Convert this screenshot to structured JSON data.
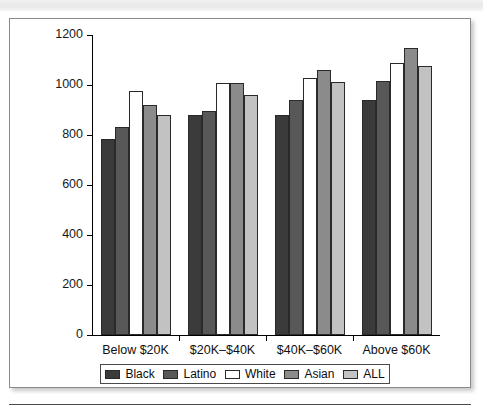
{
  "page": {
    "top_strip_text": "",
    "background_color": "#ffffff",
    "figure_border_color": "#8a8a8a"
  },
  "chart_data": {
    "type": "bar",
    "title": "",
    "subtitle": "",
    "xlabel": "",
    "ylabel": "",
    "ylim": [
      0,
      1200
    ],
    "ytick_values": [
      0,
      200,
      400,
      600,
      800,
      1000,
      1200
    ],
    "ytick_labels": [
      "0",
      "200",
      "400",
      "600",
      "800",
      "1000",
      "1200"
    ],
    "grid": false,
    "legend_position": "bottom",
    "categories": [
      "Below $20K",
      "$20K–$40K",
      "$40K–$60K",
      "Above $60K"
    ],
    "series": [
      {
        "name": "Black",
        "color": "#3b3b3b",
        "values": [
          784,
          880,
          880,
          940
        ]
      },
      {
        "name": "Latino",
        "color": "#585858",
        "values": [
          832,
          896,
          940,
          1015
        ]
      },
      {
        "name": "White",
        "color": "#ffffff",
        "values": [
          976,
          1008,
          1030,
          1088
        ]
      },
      {
        "name": "Asian",
        "color": "#8b8b8b",
        "values": [
          920,
          1010,
          1060,
          1148
        ]
      },
      {
        "name": "ALL",
        "color": "#c2c2c2",
        "values": [
          880,
          962,
          1012,
          1075
        ]
      }
    ]
  },
  "legend": {
    "items": [
      {
        "label": "Black",
        "swatch_color": "#3b3b3b"
      },
      {
        "label": "Latino",
        "swatch_color": "#585858"
      },
      {
        "label": "White",
        "swatch_color": "#ffffff"
      },
      {
        "label": "Asian",
        "swatch_color": "#8b8b8b"
      },
      {
        "label": "ALL",
        "swatch_color": "#c2c2c2"
      }
    ]
  }
}
